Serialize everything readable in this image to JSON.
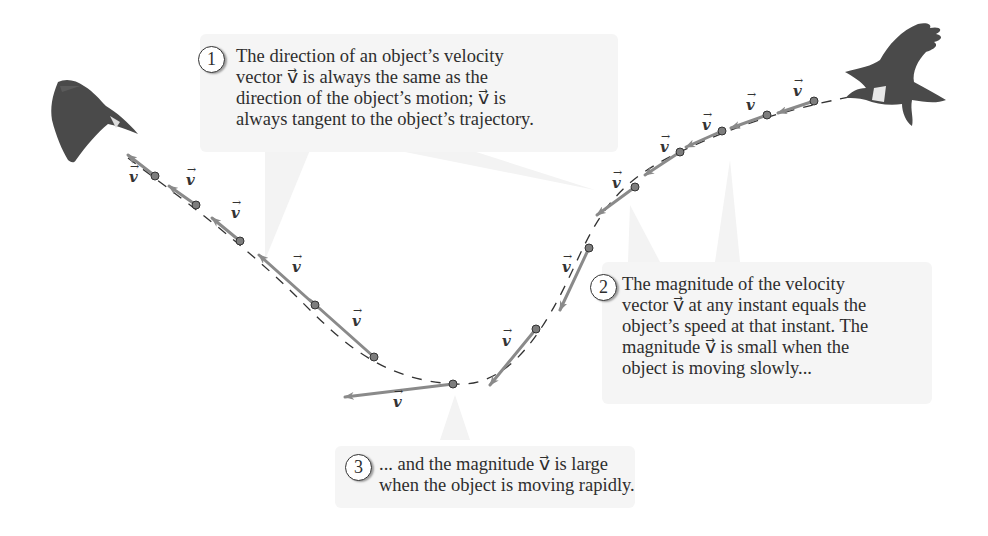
{
  "figure": {
    "vector_symbol": "v",
    "vector_arrow": "→",
    "colors": {
      "vector_arrow": "#8a8a8a",
      "point": "#7d7d7d",
      "trajectory": "#333333",
      "callout_bg": "#f5f5f5",
      "pointer": "#f2f2f2",
      "bird": "#4a4a4a"
    }
  },
  "callouts": [
    {
      "number": "1",
      "lines": [
        "The direction of an object’s velocity",
        "vector v⃗ is always the same as the",
        "direction of the object’s motion; v⃗ is",
        "always tangent to the object’s trajectory."
      ]
    },
    {
      "number": "2",
      "lines": [
        "The magnitude of the velocity",
        "vector v⃗ at any instant equals the",
        "object’s speed at that instant. The",
        "magnitude v⃗ is small when the",
        "object is moving slowly..."
      ]
    },
    {
      "number": "3",
      "lines": [
        "... and the magnitude v⃗ is large",
        "when the object is moving rapidly."
      ]
    }
  ],
  "vector_labels": [
    "v",
    "v",
    "v",
    "v",
    "v",
    "v",
    "v",
    "v",
    "v",
    "v",
    "v",
    "v",
    "v"
  ],
  "birds": [
    {
      "name": "hawk-start",
      "position": "top-right"
    },
    {
      "name": "hawk-end",
      "position": "top-left"
    }
  ]
}
